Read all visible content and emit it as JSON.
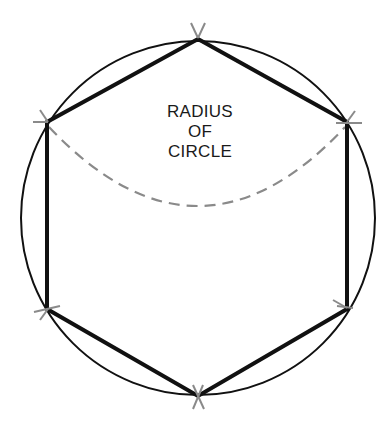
{
  "diagram": {
    "type": "geometric-construction",
    "label_lines": [
      "RADIUS",
      "OF",
      "CIRCLE"
    ],
    "colors": {
      "circle": "#111111",
      "hexagon": "#111111",
      "dashed_arc": "#8a8a8a",
      "tick_marks": "#8a8a8a",
      "text": "#1a1a1a",
      "background": "#ffffff"
    },
    "circle": {
      "cx": 198,
      "cy": 218,
      "r": 177
    },
    "hexagon_vertices": [
      [
        198,
        39
      ],
      [
        347,
        122
      ],
      [
        347,
        309
      ],
      [
        198,
        396
      ],
      [
        47,
        309
      ],
      [
        47,
        122
      ]
    ],
    "dashed_arc": {
      "from": [
        47,
        122
      ],
      "to": [
        347,
        122
      ],
      "lowest_y": 204
    }
  }
}
